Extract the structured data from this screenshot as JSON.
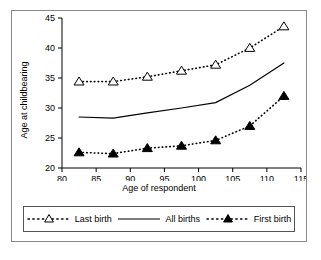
{
  "chart_data": {
    "type": "line",
    "title": "",
    "xlabel": "Age of respondent",
    "ylabel": "Age at childbearing",
    "x": [
      82.5,
      87.5,
      92.5,
      97.5,
      102.5,
      107.5,
      112.5
    ],
    "xlim": [
      80,
      115
    ],
    "ylim": [
      20,
      45
    ],
    "xticks": [
      80,
      85,
      90,
      95,
      100,
      105,
      110,
      115
    ],
    "yticks": [
      20,
      25,
      30,
      35,
      40,
      45
    ],
    "grid": false,
    "legend_position": "bottom",
    "series": [
      {
        "name": "Last birth",
        "marker": "open-triangle",
        "linestyle": "dotted",
        "color": "#000000",
        "values": [
          34.4,
          34.4,
          35.2,
          36.2,
          37.2,
          40.0,
          43.6
        ]
      },
      {
        "name": "All births",
        "marker": "none",
        "linestyle": "solid",
        "color": "#000000",
        "values": [
          28.5,
          28.3,
          29.2,
          30.0,
          30.9,
          33.8,
          37.5
        ]
      },
      {
        "name": "First birth",
        "marker": "filled-triangle",
        "linestyle": "dotted",
        "color": "#000000",
        "values": [
          22.6,
          22.4,
          23.3,
          23.7,
          24.6,
          27.0,
          32.0
        ]
      }
    ]
  },
  "legend": {
    "items": [
      {
        "label": "Last birth",
        "marker": "open-triangle-dotted-icon"
      },
      {
        "label": "All births",
        "marker": "solid-line-icon"
      },
      {
        "label": "First birth",
        "marker": "filled-triangle-dotted-icon"
      }
    ]
  }
}
